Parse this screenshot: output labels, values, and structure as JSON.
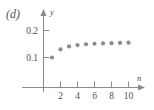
{
  "figure": {
    "panel_label": "(d)",
    "background_color": "#ffffff",
    "axis_color": "#8a8a8a",
    "point_color": "#8b8b8b",
    "text_color": "#4f4f4f"
  },
  "chart_data": {
    "type": "scatter",
    "title": "",
    "subtitle": "",
    "xlabel": "n",
    "ylabel": "y",
    "x": [
      1,
      2,
      3,
      4,
      5,
      6,
      7,
      8,
      9,
      10
    ],
    "values": [
      0.1,
      0.13,
      0.141,
      0.146,
      0.149,
      0.151,
      0.152,
      0.153,
      0.154,
      0.155
    ],
    "series": [
      {
        "name": "",
        "x": [
          1,
          2,
          3,
          4,
          5,
          6,
          7,
          8,
          9,
          10
        ],
        "values": [
          0.1,
          0.13,
          0.141,
          0.146,
          0.149,
          0.151,
          0.152,
          0.153,
          0.154,
          0.155
        ]
      }
    ],
    "xlim": [
      0,
      12.5
    ],
    "ylim": [
      0,
      0.235
    ],
    "xticks": [
      2,
      4,
      6,
      8,
      10
    ],
    "xtick_labels": [
      "2",
      "4",
      "6",
      "8",
      "10"
    ],
    "yticks": [
      0.1,
      0.2
    ],
    "ytick_labels": [
      "0.1",
      "0.2"
    ],
    "grid": false,
    "legend": "none",
    "marker": "circle",
    "annotations": [
      "(d)"
    ]
  },
  "axes": {
    "y_axis_name": "y",
    "x_axis_name": "n",
    "y_tick_1_label": "0.1",
    "y_tick_2_label": "0.2",
    "x_tick_1_label": "2",
    "x_tick_2_label": "4",
    "x_tick_3_label": "6",
    "x_tick_4_label": "8",
    "x_tick_5_label": "10"
  }
}
